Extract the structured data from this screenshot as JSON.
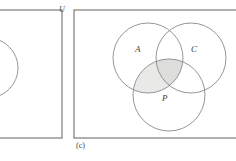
{
  "figure": {
    "caption": "(c)",
    "universe_label": "U",
    "panels": [
      {
        "id": "left-panel-partial",
        "name": "partial-venn-panel",
        "cropped": true,
        "universe_label": "U",
        "circles": [
          {
            "label": "",
            "cx": -12,
            "cy": 68,
            "r": 30,
            "partial": true
          }
        ],
        "rect": {
          "x": -40,
          "y": 10,
          "width": 102,
          "height": 128
        }
      },
      {
        "id": "right-panel-c",
        "name": "three-set-venn-panel",
        "caption": "(c)",
        "rect": {
          "x": 74,
          "y": 10,
          "width": 168,
          "height": 128
        },
        "circles": [
          {
            "label": "A",
            "cx": 148,
            "cy": 58,
            "r": 35,
            "label_x": 137,
            "label_y": 50
          },
          {
            "label": "C",
            "cx": 191,
            "cy": 58,
            "r": 35,
            "label_x": 193,
            "label_y": 50
          },
          {
            "label": "P",
            "cx": 169,
            "cy": 95,
            "r": 36,
            "label_x": 164,
            "label_y": 98
          }
        ],
        "shaded_regions": [
          {
            "description": "A intersect P",
            "fill": "#e8e8e6"
          },
          {
            "description": "A intersect C intersect P",
            "fill": "#dededc"
          }
        ]
      }
    ],
    "colors": {
      "stroke": "#8a8a8a",
      "rect_stroke": "#6f6f6f",
      "shade_light": "#e9e9e7",
      "shade_dark": "#dddddb",
      "text": "#3a3a3a",
      "background": "#ffffff"
    }
  }
}
